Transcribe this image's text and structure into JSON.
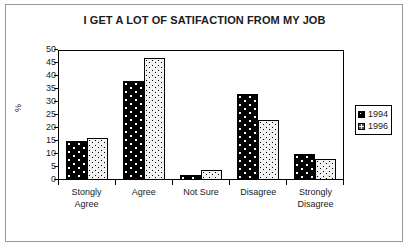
{
  "chart_data": {
    "type": "bar",
    "title": "I GET A LOT OF SATIFACTION FROM MY JOB",
    "xlabel": "",
    "ylabel": "%",
    "categories": [
      "Stongly Agree",
      "Agree",
      "Not Sure",
      "Disagree",
      "Strongly Disagree"
    ],
    "category_lines": [
      [
        "Stongly",
        "Agree"
      ],
      [
        "Agree",
        ""
      ],
      [
        "Not Sure",
        ""
      ],
      [
        "Disagree",
        ""
      ],
      [
        "Strongly",
        "Disagree"
      ]
    ],
    "series": [
      {
        "name": "1994",
        "values": [
          15,
          38,
          2,
          33,
          10
        ],
        "color": "#000000",
        "pattern": "black-with-white-dots"
      },
      {
        "name": "1996",
        "values": [
          16,
          47,
          4,
          23,
          8
        ],
        "color": "#f2f2f2",
        "pattern": "white-with-black-dots"
      }
    ],
    "ylim": [
      0,
      50
    ],
    "ytick_step": 5,
    "yticks": [
      50,
      45,
      40,
      35,
      30,
      25,
      20,
      15,
      10,
      5,
      0
    ],
    "grid": false,
    "legend_position": "right",
    "legend_entries": [
      "1994",
      "1996"
    ]
  }
}
